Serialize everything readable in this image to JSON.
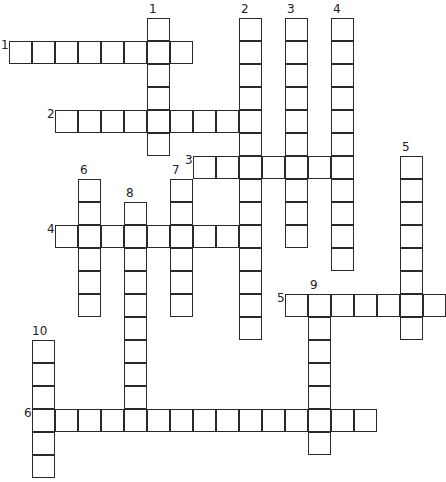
{
  "puzzle": {
    "type": "crossword",
    "cell_size": 23,
    "origin": {
      "x": 9,
      "y": 18
    },
    "colors": {
      "line": "#2a2a2a",
      "background": "#ffffff",
      "number": "#222222"
    }
  },
  "across": [
    {
      "number": "1",
      "row": 1,
      "col": 0,
      "length": 8
    },
    {
      "number": "2",
      "row": 4,
      "col": 2,
      "length": 9
    },
    {
      "number": "3",
      "row": 6,
      "col": 8,
      "length": 7
    },
    {
      "number": "4",
      "row": 9,
      "col": 2,
      "length": 9
    },
    {
      "number": "5",
      "row": 12,
      "col": 12,
      "length": 7
    },
    {
      "number": "6",
      "row": 17,
      "col": 1,
      "length": 15
    }
  ],
  "down": [
    {
      "number": "1",
      "row": 0,
      "col": 6,
      "length": 6
    },
    {
      "number": "2",
      "row": 0,
      "col": 10,
      "length": 14
    },
    {
      "number": "3",
      "row": 0,
      "col": 12,
      "length": 10
    },
    {
      "number": "4",
      "row": 0,
      "col": 14,
      "length": 11
    },
    {
      "number": "5",
      "row": 6,
      "col": 17,
      "length": 8
    },
    {
      "number": "6",
      "row": 7,
      "col": 3,
      "length": 6
    },
    {
      "number": "7",
      "row": 7,
      "col": 7,
      "length": 6
    },
    {
      "number": "8",
      "row": 8,
      "col": 5,
      "length": 10
    },
    {
      "number": "9",
      "row": 12,
      "col": 13,
      "length": 7
    },
    {
      "number": "10",
      "row": 14,
      "col": 1,
      "length": 6
    }
  ]
}
